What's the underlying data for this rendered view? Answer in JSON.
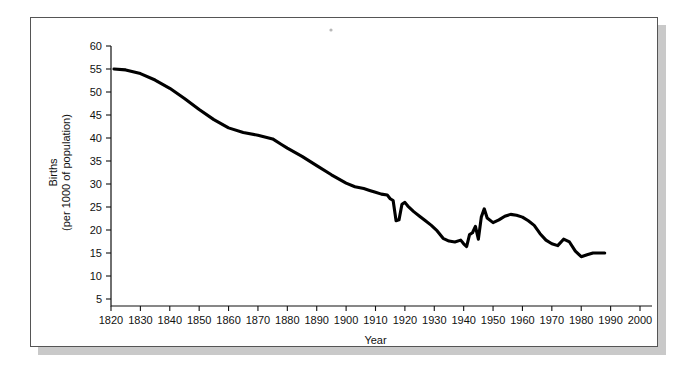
{
  "chart_data": {
    "type": "line",
    "title": "",
    "xlabel": "Year",
    "ylabel": "Births (per 1000 of population)",
    "ylabel_line1": "Births",
    "ylabel_line2": "(per 1000 of population)",
    "xlim": [
      1820,
      2000
    ],
    "ylim": [
      0,
      62
    ],
    "grid": false,
    "legend": "none",
    "line_color": "#000000",
    "xticks": [
      1820,
      1830,
      1840,
      1850,
      1860,
      1870,
      1880,
      1890,
      1900,
      1910,
      1920,
      1930,
      1940,
      1950,
      1960,
      1970,
      1980,
      1990,
      2000
    ],
    "xtick_labels": [
      "1820",
      "1830",
      "1840",
      "1850",
      "1860",
      "1870",
      "1880",
      "1890",
      "1900",
      "1910",
      "1920",
      "1930",
      "1940",
      "1950",
      "1960",
      "1970",
      "1980",
      "1990",
      "2000"
    ],
    "yticks": [
      5,
      10,
      15,
      20,
      25,
      30,
      35,
      40,
      45,
      50,
      55,
      60
    ],
    "ytick_labels": [
      "5",
      "10",
      "15",
      "20",
      "25",
      "30",
      "35",
      "40",
      "45",
      "50",
      "55",
      "60"
    ],
    "series": [
      {
        "name": "Birth rate",
        "x": [
          1821,
          1825,
          1830,
          1835,
          1840,
          1845,
          1850,
          1855,
          1860,
          1865,
          1870,
          1875,
          1878,
          1880,
          1885,
          1890,
          1895,
          1900,
          1903,
          1906,
          1908,
          1910,
          1912,
          1914,
          1915,
          1916,
          1917,
          1918,
          1919,
          1920,
          1921,
          1923,
          1925,
          1927,
          1929,
          1931,
          1933,
          1935,
          1937,
          1939,
          1940,
          1941,
          1942,
          1943,
          1944,
          1945,
          1946,
          1947,
          1948,
          1950,
          1952,
          1954,
          1956,
          1958,
          1960,
          1962,
          1964,
          1966,
          1968,
          1970,
          1972,
          1974,
          1976,
          1978,
          1980,
          1982,
          1984,
          1986,
          1988
        ],
        "y": [
          55.0,
          54.8,
          54.0,
          52.6,
          50.8,
          48.6,
          46.2,
          44.0,
          42.2,
          41.2,
          40.6,
          39.8,
          38.6,
          37.8,
          36.0,
          34.0,
          32.0,
          30.2,
          29.4,
          29.0,
          28.6,
          28.2,
          27.8,
          27.6,
          26.8,
          26.4,
          22.0,
          22.2,
          25.6,
          26.0,
          25.2,
          24.0,
          23.0,
          22.0,
          21.0,
          19.8,
          18.2,
          17.6,
          17.4,
          17.8,
          17.0,
          16.4,
          19.0,
          19.4,
          20.8,
          18.0,
          22.8,
          24.6,
          22.6,
          21.6,
          22.2,
          23.0,
          23.4,
          23.2,
          22.8,
          22.0,
          21.0,
          19.2,
          17.8,
          17.0,
          16.6,
          18.0,
          17.4,
          15.4,
          14.2,
          14.6,
          15.0,
          15.0,
          15.0
        ]
      }
    ]
  },
  "annotations": {
    "speck_present": true
  }
}
